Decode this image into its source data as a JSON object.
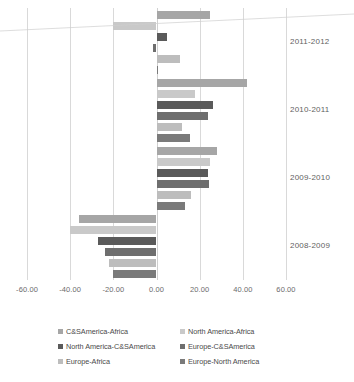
{
  "chart_data": {
    "type": "bar",
    "orientation": "horizontal",
    "title": "",
    "xlabel": "",
    "ylabel": "",
    "xlim": [
      -60,
      60
    ],
    "grid": true,
    "legend_position": "bottom",
    "categories": [
      "2011-2012",
      "2010-2011",
      "2009-2010",
      "2008-2009"
    ],
    "tick_labels": [
      "-60.00",
      "-40.00",
      "-20.00",
      "0.00",
      "20.00",
      "40.00",
      "60.00"
    ],
    "tick_values": [
      -60,
      -40,
      -20,
      0,
      20,
      40,
      60
    ],
    "series": [
      {
        "name": "C&SAmerica-Africa",
        "color": "#a6a6a6",
        "values": [
          25.0,
          42.0,
          28.0,
          -36.0
        ]
      },
      {
        "name": "North America-Africa",
        "color": "#c9c9c9",
        "values": [
          -20.0,
          18.0,
          25.0,
          -40.0
        ]
      },
      {
        "name": "North America-C&SAmerica",
        "color": "#5a5a5a",
        "values": [
          5.0,
          26.0,
          24.0,
          -27.0
        ]
      },
      {
        "name": "Europe-C&SAmerica",
        "color": "#6e6e6e",
        "values": [
          -1.5,
          24.0,
          24.5,
          -24.0
        ]
      },
      {
        "name": "Europe-Africa",
        "color": "#bdbdbd",
        "values": [
          11.0,
          12.0,
          16.0,
          -22.0
        ]
      },
      {
        "name": "Europe-North America",
        "color": "#7a7a7a",
        "values": [
          0.8,
          15.5,
          13.0,
          -20.0
        ]
      }
    ]
  },
  "legend": {
    "items": [
      {
        "label": "C&SAmerica-Africa",
        "color": "#a6a6a6"
      },
      {
        "label": "North America-Africa",
        "color": "#c9c9c9"
      },
      {
        "label": "North America-C&SAmerica",
        "color": "#5a5a5a"
      },
      {
        "label": "Europe-C&SAmerica",
        "color": "#6e6e6e"
      },
      {
        "label": "Europe-Africa",
        "color": "#bdbdbd"
      },
      {
        "label": "Europe-North America",
        "color": "#7a7a7a"
      }
    ]
  },
  "colors": {
    "gridline": "#d9d9d9",
    "axis_text": "#6b6b6b",
    "background": "#ffffff"
  }
}
